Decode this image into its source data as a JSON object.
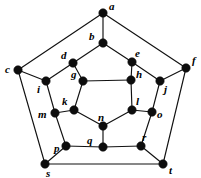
{
  "diagram": {
    "type": "planar-graph",
    "width": 201,
    "height": 178,
    "colors": {
      "background": "#ffffff",
      "edge": "#111111",
      "node": "#0d0d0d",
      "label": "#000000"
    },
    "node_radius": 4.2,
    "nodes": [
      {
        "id": "a",
        "label": "a",
        "x": 103,
        "y": 13,
        "label_dx": 6,
        "label_dy": -12
      },
      {
        "id": "b",
        "label": "b",
        "x": 103,
        "y": 43,
        "label_dx": -14,
        "label_dy": -12
      },
      {
        "id": "c",
        "label": "c",
        "x": 18,
        "y": 70,
        "label_dx": -13,
        "label_dy": -6
      },
      {
        "id": "d",
        "label": "d",
        "x": 73,
        "y": 63,
        "label_dx": -12,
        "label_dy": -13
      },
      {
        "id": "e",
        "label": "e",
        "x": 132,
        "y": 62,
        "label_dx": 3,
        "label_dy": -14
      },
      {
        "id": "f",
        "label": "f",
        "x": 186,
        "y": 68,
        "label_dx": 6,
        "label_dy": -13
      },
      {
        "id": "g",
        "label": "g",
        "x": 83,
        "y": 81,
        "label_dx": -12,
        "label_dy": -12
      },
      {
        "id": "h",
        "label": "h",
        "x": 131,
        "y": 80,
        "label_dx": 5,
        "label_dy": -11
      },
      {
        "id": "i",
        "label": "i",
        "x": 46,
        "y": 81,
        "label_dx": -9,
        "label_dy": 3
      },
      {
        "id": "j",
        "label": "j",
        "x": 160,
        "y": 81,
        "label_dx": 4,
        "label_dy": 3
      },
      {
        "id": "k",
        "label": "k",
        "x": 74,
        "y": 110,
        "label_dx": -12,
        "label_dy": -14
      },
      {
        "id": "l",
        "label": "l",
        "x": 132,
        "y": 110,
        "label_dx": 4,
        "label_dy": -14
      },
      {
        "id": "m",
        "label": "m",
        "x": 55,
        "y": 113,
        "label_dx": -17,
        "label_dy": -4
      },
      {
        "id": "n",
        "label": "n",
        "x": 103,
        "y": 126,
        "label_dx": -5,
        "label_dy": -14
      },
      {
        "id": "o",
        "label": "o",
        "x": 152,
        "y": 112,
        "label_dx": 5,
        "label_dy": -3
      },
      {
        "id": "p",
        "label": "p",
        "x": 66,
        "y": 146,
        "label_dx": -12,
        "label_dy": -3
      },
      {
        "id": "q",
        "label": "q",
        "x": 103,
        "y": 147,
        "label_dx": -16,
        "label_dy": -12
      },
      {
        "id": "r",
        "label": "r",
        "x": 141,
        "y": 146,
        "label_dx": 1,
        "label_dy": -14
      },
      {
        "id": "s",
        "label": "s",
        "x": 45,
        "y": 164,
        "label_dx": 1,
        "label_dy": 4
      },
      {
        "id": "t",
        "label": "t",
        "x": 163,
        "y": 164,
        "label_dx": 6,
        "label_dy": 1
      }
    ],
    "edges": [
      {
        "from": "a",
        "to": "b"
      },
      {
        "from": "a",
        "to": "c"
      },
      {
        "from": "a",
        "to": "f"
      },
      {
        "from": "b",
        "to": "d"
      },
      {
        "from": "b",
        "to": "e"
      },
      {
        "from": "c",
        "to": "i"
      },
      {
        "from": "c",
        "to": "s"
      },
      {
        "from": "d",
        "to": "g"
      },
      {
        "from": "d",
        "to": "i"
      },
      {
        "from": "e",
        "to": "h"
      },
      {
        "from": "e",
        "to": "j"
      },
      {
        "from": "f",
        "to": "j"
      },
      {
        "from": "f",
        "to": "t"
      },
      {
        "from": "g",
        "to": "h"
      },
      {
        "from": "g",
        "to": "k"
      },
      {
        "from": "h",
        "to": "l"
      },
      {
        "from": "i",
        "to": "m"
      },
      {
        "from": "j",
        "to": "o"
      },
      {
        "from": "k",
        "to": "m"
      },
      {
        "from": "k",
        "to": "n"
      },
      {
        "from": "l",
        "to": "n"
      },
      {
        "from": "l",
        "to": "o"
      },
      {
        "from": "m",
        "to": "p"
      },
      {
        "from": "n",
        "to": "q"
      },
      {
        "from": "o",
        "to": "r"
      },
      {
        "from": "p",
        "to": "q"
      },
      {
        "from": "p",
        "to": "s"
      },
      {
        "from": "q",
        "to": "r"
      },
      {
        "from": "r",
        "to": "t"
      },
      {
        "from": "s",
        "to": "t"
      }
    ]
  }
}
